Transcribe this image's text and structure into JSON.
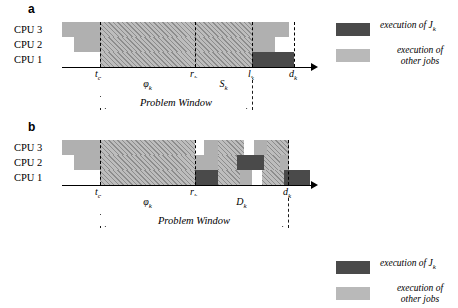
{
  "figure": {
    "type": "gantt-schedule-diagram"
  },
  "panels": [
    {
      "id": "a",
      "letter": "a",
      "cpu_labels": [
        "CPU 3",
        "CPU 2",
        "CPU 1"
      ],
      "ticks": [
        {
          "name": "t_o",
          "symbol": "t",
          "sub": "o",
          "x": 38
        },
        {
          "name": "r_k",
          "symbol": "r",
          "sub": "k",
          "x": 133
        },
        {
          "name": "l_k",
          "symbol": "l",
          "sub": "k",
          "x": 190
        },
        {
          "name": "d_k",
          "symbol": "d",
          "sub": "k",
          "x": 232
        }
      ],
      "measures": [
        {
          "name": "phi",
          "symbol": "φ",
          "sub": "k",
          "from": 38,
          "to": 133
        },
        {
          "name": "S",
          "symbol": "S",
          "sub": "k",
          "from": 133,
          "to": 190
        },
        {
          "name": "problem-window",
          "symbol": "Problem Window",
          "sub": "",
          "from": 38,
          "to": 190
        }
      ],
      "rows": [
        {
          "cpu": "CPU 3",
          "blocks": [
            {
              "kind": "gray",
              "x": 0,
              "w": 38
            },
            {
              "kind": "hatch",
              "x": 38,
              "w": 152
            },
            {
              "kind": "gray",
              "x": 190,
              "w": 37
            },
            {
              "kind": "white",
              "x": 227,
              "w": 21
            }
          ]
        },
        {
          "cpu": "CPU 2",
          "blocks": [
            {
              "kind": "white",
              "x": 0,
              "w": 12
            },
            {
              "kind": "gray",
              "x": 12,
              "w": 26
            },
            {
              "kind": "hatch",
              "x": 38,
              "w": 152
            },
            {
              "kind": "gray",
              "x": 190,
              "w": 23
            },
            {
              "kind": "white",
              "x": 213,
              "w": 35
            }
          ]
        },
        {
          "cpu": "CPU 1",
          "blocks": [
            {
              "kind": "white",
              "x": 0,
              "w": 38
            },
            {
              "kind": "hatch",
              "x": 38,
              "w": 152
            },
            {
              "kind": "dark",
              "x": 190,
              "w": 42
            },
            {
              "kind": "white",
              "x": 232,
              "w": 16
            }
          ]
        }
      ]
    },
    {
      "id": "b",
      "letter": "b",
      "cpu_labels": [
        "CPU 3",
        "CPU 2",
        "CPU 1"
      ],
      "ticks": [
        {
          "name": "t_o",
          "symbol": "t",
          "sub": "o",
          "x": 38
        },
        {
          "name": "r_k",
          "symbol": "r",
          "sub": "k",
          "x": 133
        },
        {
          "name": "d_k",
          "symbol": "d",
          "sub": "k",
          "x": 226
        }
      ],
      "measures": [
        {
          "name": "phi",
          "symbol": "φ",
          "sub": "k",
          "from": 38,
          "to": 133
        },
        {
          "name": "D",
          "symbol": "D",
          "sub": "k",
          "from": 133,
          "to": 226
        },
        {
          "name": "problem-window",
          "symbol": "Problem Window",
          "sub": "",
          "from": 38,
          "to": 226
        }
      ],
      "rows": [
        {
          "cpu": "CPU 3",
          "blocks": [
            {
              "kind": "gray",
              "x": 0,
              "w": 38
            },
            {
              "kind": "hatch",
              "x": 38,
              "w": 95
            },
            {
              "kind": "white",
              "x": 133,
              "w": 9
            },
            {
              "kind": "gray",
              "x": 142,
              "w": 14
            },
            {
              "kind": "hatch",
              "x": 156,
              "w": 26
            },
            {
              "kind": "white",
              "x": 182,
              "w": 10
            },
            {
              "kind": "gray",
              "x": 192,
              "w": 13
            },
            {
              "kind": "hatch",
              "x": 205,
              "w": 22
            },
            {
              "kind": "white",
              "x": 227,
              "w": 21
            }
          ]
        },
        {
          "cpu": "CPU 2",
          "blocks": [
            {
              "kind": "white",
              "x": 0,
              "w": 12
            },
            {
              "kind": "gray",
              "x": 12,
              "w": 26
            },
            {
              "kind": "hatch",
              "x": 38,
              "w": 95
            },
            {
              "kind": "gray",
              "x": 133,
              "w": 23
            },
            {
              "kind": "hatch",
              "x": 156,
              "w": 19
            },
            {
              "kind": "dark",
              "x": 175,
              "w": 27
            },
            {
              "kind": "hatch",
              "x": 202,
              "w": 16
            },
            {
              "kind": "gray",
              "x": 218,
              "w": 9
            },
            {
              "kind": "white",
              "x": 227,
              "w": 21
            }
          ]
        },
        {
          "cpu": "CPU 1",
          "blocks": [
            {
              "kind": "white",
              "x": 0,
              "w": 38
            },
            {
              "kind": "hatch",
              "x": 38,
              "w": 95
            },
            {
              "kind": "dark",
              "x": 133,
              "w": 23
            },
            {
              "kind": "hatch",
              "x": 156,
              "w": 22
            },
            {
              "kind": "gray",
              "x": 178,
              "w": 12
            },
            {
              "kind": "white",
              "x": 190,
              "w": 10
            },
            {
              "kind": "hatch",
              "x": 200,
              "w": 22
            },
            {
              "kind": "dark",
              "x": 222,
              "w": 26
            },
            {
              "kind": "white",
              "x": 248,
              "w": 0
            }
          ]
        }
      ]
    }
  ],
  "legend": {
    "items": [
      {
        "swatch": "dark",
        "text_line1": "execution of J",
        "sub": "k",
        "text_line2": ""
      },
      {
        "swatch": "gray",
        "text_line1": "execution of",
        "sub": "",
        "text_line2": "other jobs"
      }
    ]
  },
  "colors": {
    "dark_block": "#4a4a4a",
    "gray_block": "#b0b0b0",
    "hatch_light": "#bdbdbd",
    "hatch_line": "#8d8d8d",
    "axis": "#000000",
    "background": "#ffffff"
  }
}
